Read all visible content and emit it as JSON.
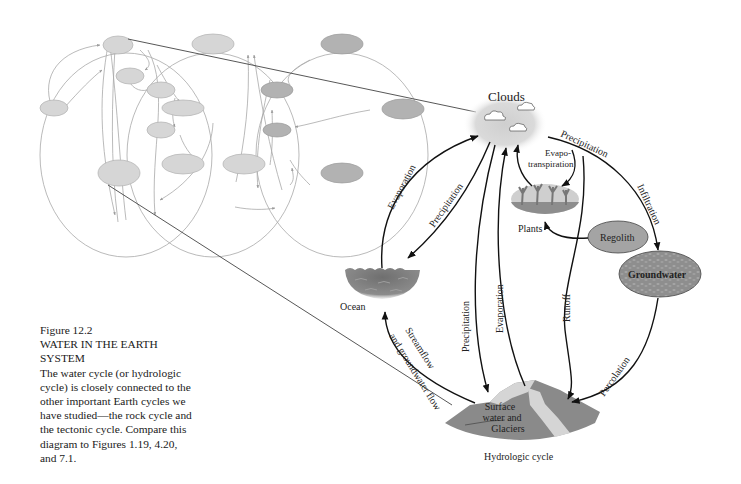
{
  "caption": {
    "figure_number": "Figure 12.2",
    "title_line1": "WATER IN THE EARTH",
    "title_line2": "SYSTEM",
    "body_lines": [
      "The water cycle (or hydrologic",
      "cycle) is closely connected to the",
      "other important Earth cycles we",
      "have studied—the rock cycle and",
      "the tectonic cycle. Compare this",
      "diagram to Figures 1.19, 4.20,",
      "and 7.1."
    ]
  },
  "hydrologic_cycle": {
    "title": "Hydrologic cycle",
    "reservoirs": {
      "clouds": "Clouds",
      "plants": "Plants",
      "regolith": "Regolith",
      "groundwater": "Groundwater",
      "ocean": "Ocean",
      "surface_line1": "Surface",
      "surface_line2": "water and",
      "surface_line3": "Glaciers"
    },
    "flows": {
      "evaporation_ocean": "Evaporation",
      "precipitation_ocean": "Precipitation",
      "precipitation_land": "Precipitation",
      "evaporation_land": "Evaporation",
      "evapotranspiration_line1": "Evapo-",
      "evapotranspiration_line2": "transpiration",
      "precipitation_right": "Precipitation",
      "infiltration": "Infiltration",
      "runoff": "Runoff",
      "percolation": "Percolation",
      "streamflow_line1": "Streamflow",
      "streamflow_line2": "and groundwater flow"
    }
  },
  "colors": {
    "light_node": "#d4d4d4",
    "dark_node": "#a9a9a9",
    "regolith": "#9e9e9e",
    "groundwater": "#8f8f8f",
    "mountain": "#8a8a8a",
    "glacier": "#d8d8d8",
    "ocean": "#7d7d7d",
    "clouds_halo": "#dcdcdc"
  }
}
